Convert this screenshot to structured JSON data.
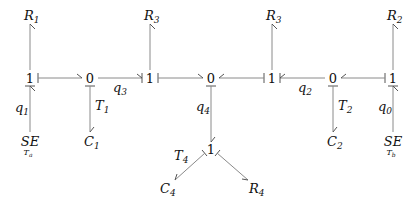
{
  "diagram": {
    "type": "bond-graph",
    "junctions": [
      {
        "id": "j1",
        "label": "1",
        "x": 30,
        "y": 78
      },
      {
        "id": "j2",
        "label": "0",
        "x": 90,
        "y": 78
      },
      {
        "id": "j3",
        "label": "1",
        "x": 150,
        "y": 78
      },
      {
        "id": "j4",
        "label": "0",
        "x": 211,
        "y": 78
      },
      {
        "id": "j5",
        "label": "1",
        "x": 272,
        "y": 78
      },
      {
        "id": "j6",
        "label": "0",
        "x": 333,
        "y": 78
      },
      {
        "id": "j7",
        "label": "1",
        "x": 393,
        "y": 78
      },
      {
        "id": "j8",
        "label": "1",
        "x": 211,
        "y": 150
      }
    ],
    "elements": [
      {
        "id": "R1",
        "main": "R",
        "sub": "1",
        "x": 30,
        "y": 18
      },
      {
        "id": "R3a",
        "main": "R",
        "sub": "3",
        "x": 150,
        "y": 18
      },
      {
        "id": "R3b",
        "main": "R",
        "sub": "3",
        "x": 272,
        "y": 18
      },
      {
        "id": "R2",
        "main": "R",
        "sub": "2",
        "x": 393,
        "y": 18
      },
      {
        "id": "SEa",
        "main": "SE",
        "under": "T",
        "underSub": "a",
        "x": 30,
        "y": 144
      },
      {
        "id": "C1",
        "main": "C",
        "sub": "1",
        "x": 90,
        "y": 144
      },
      {
        "id": "C2",
        "main": "C",
        "sub": "2",
        "x": 333,
        "y": 144
      },
      {
        "id": "SEb",
        "main": "SE",
        "under": "T",
        "underSub": "b",
        "x": 393,
        "y": 144
      },
      {
        "id": "C4",
        "main": "C",
        "sub": "4",
        "x": 170,
        "y": 191
      },
      {
        "id": "R4",
        "main": "R",
        "sub": "4",
        "x": 252,
        "y": 191
      }
    ],
    "bond_labels": [
      {
        "main": "q",
        "sub": "1",
        "x": 16,
        "y": 113
      },
      {
        "main": "T",
        "sub": "1",
        "x": 98,
        "y": 113
      },
      {
        "main": "q",
        "sub": "3",
        "x": 114,
        "y": 94
      },
      {
        "main": "q",
        "sub": "4",
        "x": 196,
        "y": 113
      },
      {
        "main": "q",
        "sub": "2",
        "x": 302,
        "y": 94
      },
      {
        "main": "T",
        "sub": "2",
        "x": 341,
        "y": 113
      },
      {
        "main": "q",
        "sub": "0",
        "x": 378,
        "y": 113
      },
      {
        "main": "T",
        "sub": "4",
        "x": 175,
        "y": 161
      }
    ]
  }
}
